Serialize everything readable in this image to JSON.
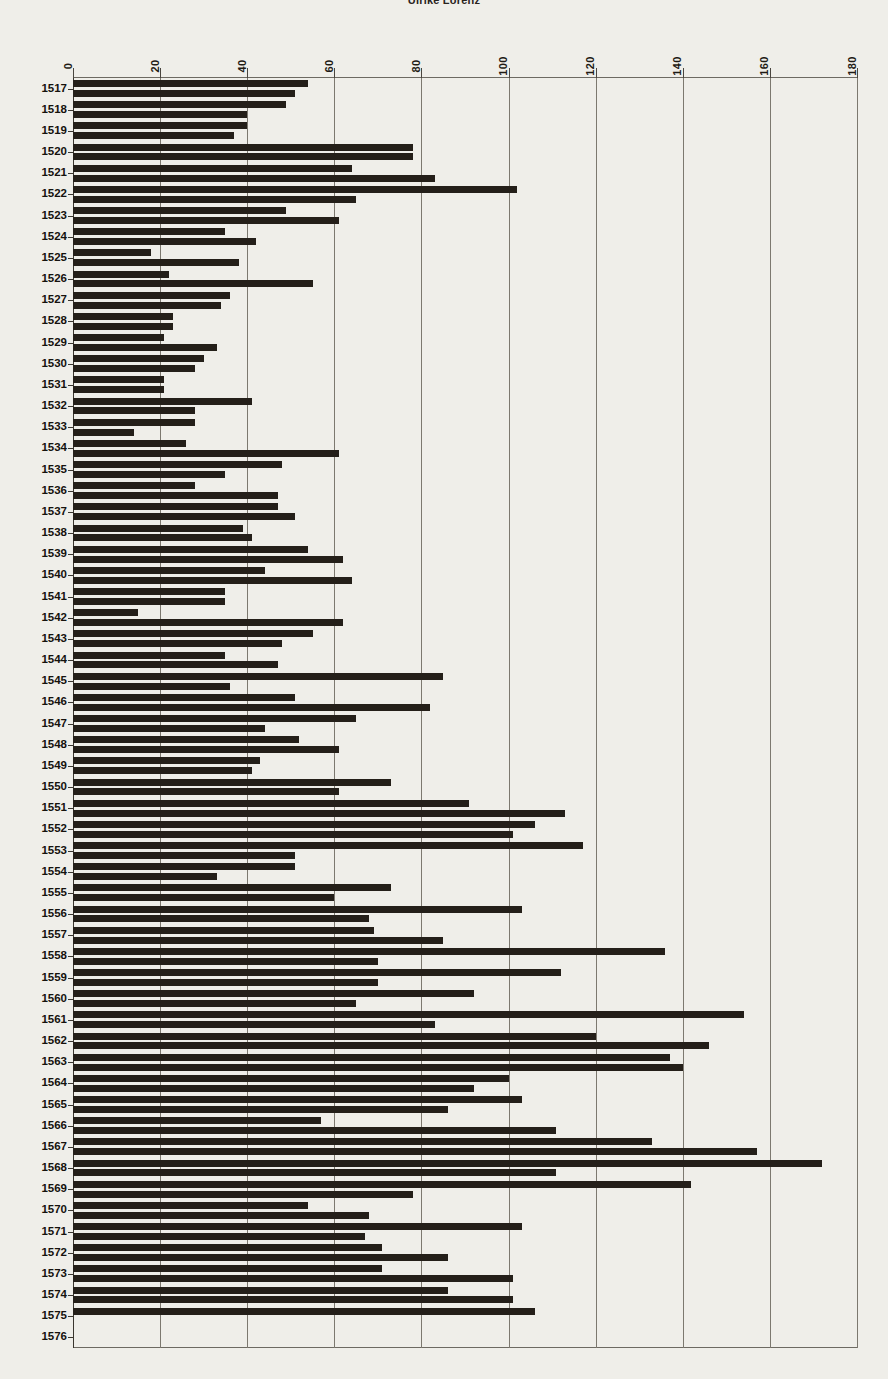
{
  "chart_data": {
    "type": "bar",
    "orientation": "horizontal",
    "title": "Ulrike Lorenz",
    "xlabel": "",
    "ylabel": "",
    "xlim": [
      0,
      180
    ],
    "xticks": [
      0,
      20,
      40,
      60,
      80,
      100,
      120,
      140,
      160,
      180
    ],
    "grid": true,
    "legend": "none",
    "series": [
      {
        "name": "series-a"
      },
      {
        "name": "series-b"
      }
    ],
    "categories": [
      "1517",
      "1518",
      "1519",
      "1520",
      "1521",
      "1522",
      "1523",
      "1524",
      "1525",
      "1526",
      "1527",
      "1528",
      "1529",
      "1530",
      "1531",
      "1532",
      "1533",
      "1534",
      "1535",
      "1536",
      "1537",
      "1538",
      "1539",
      "1540",
      "1541",
      "1542",
      "1543",
      "1544",
      "1545",
      "1546",
      "1547",
      "1548",
      "1549",
      "1550",
      "1551",
      "1552",
      "1553",
      "1554",
      "1555",
      "1556",
      "1557",
      "1558",
      "1559",
      "1560",
      "1561",
      "1562",
      "1563",
      "1564",
      "1565",
      "1566",
      "1567",
      "1568",
      "1569",
      "1570",
      "1571",
      "1572",
      "1573",
      "1574",
      "1575",
      "1576"
    ],
    "rows": [
      {
        "year": "1517",
        "a": 54,
        "b": 51
      },
      {
        "year": "1518",
        "a": 49,
        "b": 40
      },
      {
        "year": "1519",
        "a": 40,
        "b": 37
      },
      {
        "year": "1520",
        "a": 78,
        "b": 78
      },
      {
        "year": "1521",
        "a": 64,
        "b": 83
      },
      {
        "year": "1522",
        "a": 102,
        "b": 65
      },
      {
        "year": "1523",
        "a": 49,
        "b": 61
      },
      {
        "year": "1524",
        "a": 35,
        "b": 42
      },
      {
        "year": "1525",
        "a": 18,
        "b": 38
      },
      {
        "year": "1526",
        "a": 22,
        "b": 55
      },
      {
        "year": "1527",
        "a": 36,
        "b": 34
      },
      {
        "year": "1528",
        "a": 23,
        "b": 23
      },
      {
        "year": "1529",
        "a": 21,
        "b": 33
      },
      {
        "year": "1530",
        "a": 30,
        "b": 28
      },
      {
        "year": "1531",
        "a": 21,
        "b": 21
      },
      {
        "year": "1532",
        "a": 41,
        "b": 28
      },
      {
        "year": "1533",
        "a": 28,
        "b": 14
      },
      {
        "year": "1534",
        "a": 26,
        "b": 61
      },
      {
        "year": "1535",
        "a": 48,
        "b": 35
      },
      {
        "year": "1536",
        "a": 28,
        "b": 47
      },
      {
        "year": "1537",
        "a": 47,
        "b": 51
      },
      {
        "year": "1538",
        "a": 39,
        "b": 41
      },
      {
        "year": "1539",
        "a": 54,
        "b": 62
      },
      {
        "year": "1540",
        "a": 44,
        "b": 64
      },
      {
        "year": "1541",
        "a": 35,
        "b": 35
      },
      {
        "year": "1542",
        "a": 15,
        "b": 62
      },
      {
        "year": "1543",
        "a": 55,
        "b": 48
      },
      {
        "year": "1544",
        "a": 35,
        "b": 47
      },
      {
        "year": "1545",
        "a": 85,
        "b": 36
      },
      {
        "year": "1546",
        "a": 51,
        "b": 82
      },
      {
        "year": "1547",
        "a": 65,
        "b": 44
      },
      {
        "year": "1548",
        "a": 52,
        "b": 61
      },
      {
        "year": "1549",
        "a": 43,
        "b": 41
      },
      {
        "year": "1550",
        "a": 73,
        "b": 61
      },
      {
        "year": "1551",
        "a": 91,
        "b": 113
      },
      {
        "year": "1552",
        "a": 106,
        "b": 101
      },
      {
        "year": "1553",
        "a": 117,
        "b": 51
      },
      {
        "year": "1554",
        "a": 51,
        "b": 33
      },
      {
        "year": "1555",
        "a": 73,
        "b": 60
      },
      {
        "year": "1556",
        "a": 103,
        "b": 68
      },
      {
        "year": "1557",
        "a": 69,
        "b": 85
      },
      {
        "year": "1558",
        "a": 136,
        "b": 70
      },
      {
        "year": "1559",
        "a": 112,
        "b": 70
      },
      {
        "year": "1560",
        "a": 92,
        "b": 65
      },
      {
        "year": "1561",
        "a": 154,
        "b": 83
      },
      {
        "year": "1562",
        "a": 120,
        "b": 146
      },
      {
        "year": "1563",
        "a": 137,
        "b": 140
      },
      {
        "year": "1564",
        "a": 100,
        "b": 92
      },
      {
        "year": "1565",
        "a": 103,
        "b": 86
      },
      {
        "year": "1566",
        "a": 57,
        "b": 111
      },
      {
        "year": "1567",
        "a": 133,
        "b": 157
      },
      {
        "year": "1568",
        "a": 172,
        "b": 111
      },
      {
        "year": "1569",
        "a": 142,
        "b": 78
      },
      {
        "year": "1570",
        "a": 54,
        "b": 68
      },
      {
        "year": "1571",
        "a": 103,
        "b": 67
      },
      {
        "year": "1572",
        "a": 71,
        "b": 86
      },
      {
        "year": "1573",
        "a": 71,
        "b": 101
      },
      {
        "year": "1574",
        "a": 86,
        "b": 101
      },
      {
        "year": "1575",
        "a": 106,
        "b": 0
      },
      {
        "year": "1576",
        "a": 0,
        "b": 0
      }
    ]
  },
  "colors": {
    "background": "#efeee9",
    "bar": "#241f19",
    "grid": "#7c786f",
    "axis": "#3a362f",
    "text": "#15120e"
  }
}
